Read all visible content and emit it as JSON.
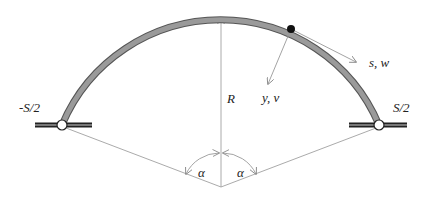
{
  "diagram": {
    "labels": {
      "left_support": "-S/2",
      "right_support": "S/2",
      "radius": "R",
      "tangent_axis": "s, w",
      "normal_axis": "y, v",
      "angle_left": "α",
      "angle_right": "α"
    },
    "geometry": {
      "center": [
        221,
        187
      ],
      "radius_px": 172,
      "left_support": [
        62,
        125
      ],
      "right_support": [
        379,
        125
      ],
      "material_point": [
        291,
        29
      ]
    },
    "colors": {
      "arch": "#8a8a8a",
      "arch_edge": "#555555",
      "support_bar": "#222222",
      "construction_line": "#999999",
      "text": "#222222"
    }
  }
}
